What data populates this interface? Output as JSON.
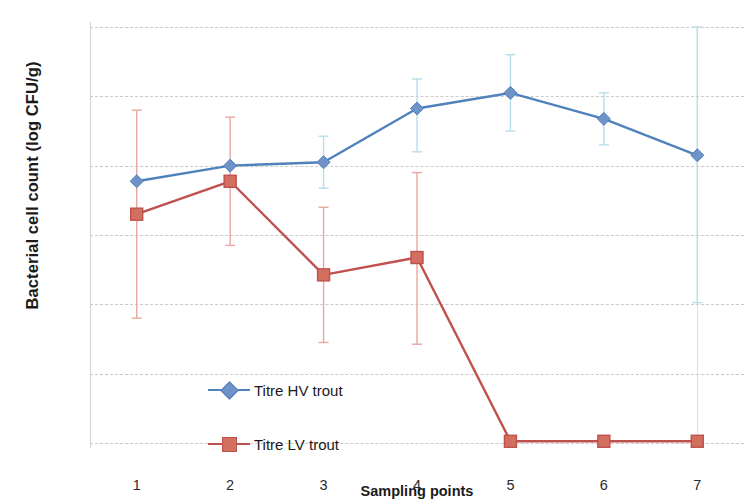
{
  "chart_data": {
    "type": "line",
    "title": "",
    "xlabel": "Sampling points",
    "ylabel": "Bacterial cell count (log CFU/g)",
    "categories": [
      "1",
      "2",
      "3",
      "4",
      "5",
      "6",
      "7"
    ],
    "ylim": [
      0,
      12
    ],
    "ytick_labels": [
      "0",
      "2",
      "4",
      "6",
      "8",
      "10",
      "12"
    ],
    "ytick_values": [
      0,
      2,
      4,
      6,
      8,
      10,
      12
    ],
    "grid": true,
    "grid_axis": "y",
    "legend_position": "inside lower-left",
    "series": [
      {
        "name": "Titre HV trout",
        "color": "#4f81bd",
        "errorbar_color": "#b7dde8",
        "marker": "diamond",
        "values": [
          7.55,
          8.0,
          8.1,
          9.65,
          10.1,
          9.35,
          8.3
        ],
        "err_low": [
          null,
          null,
          7.35,
          8.4,
          9.0,
          8.6,
          4.05
        ],
        "err_high": [
          null,
          null,
          8.85,
          10.5,
          11.2,
          10.1,
          12.0
        ]
      },
      {
        "name": "Titre LV trout",
        "color": "#c0504d",
        "errorbar_color": "#e8a79f",
        "marker": "square",
        "values": [
          6.6,
          7.55,
          4.85,
          5.35,
          0.05,
          0.05,
          0.05
        ],
        "err_low": [
          3.6,
          5.7,
          2.9,
          2.85,
          null,
          null,
          null
        ],
        "err_high": [
          9.6,
          9.4,
          6.8,
          7.8,
          null,
          null,
          null
        ]
      }
    ]
  },
  "legend": {
    "items": [
      {
        "label": "Titre HV trout"
      },
      {
        "label": "Titre LV trout"
      }
    ]
  },
  "colors": {
    "series_hv": "#4f81bd",
    "series_lv": "#c0504d",
    "errorbar_hv": "#b7dde8",
    "errorbar_lv": "#e8a79f",
    "gridline": "#c9c9c9",
    "axis": "#d2d2d2",
    "text": "#1a1a1a"
  }
}
